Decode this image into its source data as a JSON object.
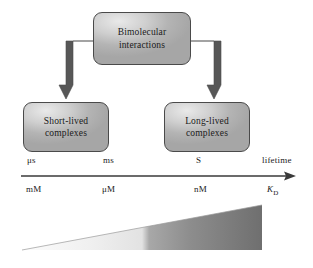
{
  "figure": {
    "background_color": "#ffffff"
  },
  "nodes": {
    "root": {
      "line1": "Bimolecular",
      "line2": "interactions"
    },
    "short_lived": {
      "line1": "Short-lived",
      "line2": "complexes"
    },
    "long_lived": {
      "line1": "Long-lived",
      "line2": "complexes"
    }
  },
  "connectors": {
    "left_arrow": "elbow-arrow-down-left",
    "right_arrow": "elbow-arrow-down-right",
    "color": "#575757"
  },
  "axes": {
    "lifetime": {
      "name": "lifetime",
      "arrow_color": "#3a3a3a",
      "ticks": [
        "μs",
        "ms",
        "S"
      ],
      "end_label": "lifetime"
    },
    "kd": {
      "name": "K_D",
      "ticks": [
        "mM",
        "μM",
        "nM"
      ],
      "end_label_main": "K",
      "end_label_sub": "D"
    }
  },
  "wedge": {
    "name": "affinity-gradient-wedge",
    "gradient_light": "#f2f2f2",
    "gradient_dark": "#767676",
    "transition_x_fraction": 0.52
  }
}
